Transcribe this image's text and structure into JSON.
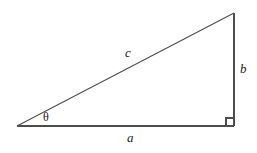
{
  "figure": {
    "type": "right-triangle-diagram",
    "width": 257,
    "height": 153,
    "background_color": "#ffffff",
    "stroke_color": "#4d4d4d",
    "text_color": "#1a1a1a",
    "stroke_width": 1
  },
  "geometry": {
    "vertices": {
      "left": {
        "name": "left-vertex",
        "x": 17,
        "y": 126
      },
      "bottom_right": {
        "name": "right-angle-vertex",
        "x": 234,
        "y": 126
      },
      "top_right": {
        "name": "top-vertex",
        "x": 234,
        "y": 13
      }
    },
    "edges": {
      "base": {
        "name": "side-a",
        "x1": 17,
        "y1": 126,
        "x2": 234,
        "y2": 126
      },
      "vertical": {
        "name": "side-b",
        "x1": 234,
        "y1": 126,
        "x2": 234,
        "y2": 13
      },
      "hypotenuse": {
        "name": "side-c",
        "x1": 17,
        "y1": 126,
        "x2": 234,
        "y2": 13
      }
    },
    "right_angle_marker": {
      "x": 226,
      "y": 118,
      "size": 8
    }
  },
  "labels": {
    "hypotenuse": "c",
    "opposite": "b",
    "adjacent": "a",
    "angle": "θ"
  }
}
